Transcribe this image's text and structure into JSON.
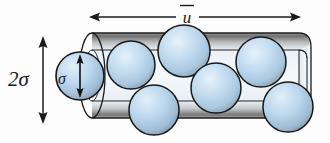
{
  "figure": {
    "name": "collision-cylinder-diagram",
    "caption_visible": false,
    "background_color": "#fdfdfd"
  },
  "labels": {
    "length_label": "ū",
    "length_label_plain": "u-bar",
    "diameter_label": "2σ",
    "radius_label": "σ"
  },
  "colors": {
    "sphere_fill_light": "#d8eaf7",
    "sphere_fill_mid": "#b4d4ec",
    "sphere_fill_dark": "#8fa9bd",
    "sphere_outline": "#1c1c1c",
    "cylinder_top_dark": "#6e6e6e",
    "cylinder_top_light": "#e9ecee",
    "cylinder_body_light": "#eef4f8",
    "cylinder_body_tint": "#dfeaf2",
    "cylinder_outline": "#1c1c1c",
    "arrow_color": "#1a1a1a",
    "text_color": "#1a1a1a"
  },
  "annotations": {
    "length_arrow": {
      "name": "mean-speed-arrow",
      "orientation": "horizontal",
      "double_headed": true,
      "x_start": 90,
      "x_end": 300,
      "y": 17,
      "label": "ū"
    },
    "diameter_arrow": {
      "name": "cylinder-diameter-arrow",
      "orientation": "vertical",
      "double_headed": true,
      "x": 43,
      "y_start": 38,
      "y_end": 122,
      "label": "2σ"
    },
    "radius_arrow": {
      "name": "molecule-diameter-arrow",
      "orientation": "vertical",
      "double_headed": true,
      "x": 80,
      "y_start": 56,
      "y_end": 96,
      "label": "σ"
    }
  },
  "cylinder": {
    "name": "collision-cylinder",
    "left_x": 92,
    "right_x": 305,
    "top_y": 33,
    "bottom_y": 118,
    "cap_rx": 13,
    "cap_ry": 42
  },
  "spheres": [
    {
      "id": "lead-molecule",
      "cx": 80,
      "cy": 76,
      "r": 24
    },
    {
      "id": "molecule-1",
      "cx": 131,
      "cy": 65,
      "r": 24
    },
    {
      "id": "molecule-2",
      "cx": 184,
      "cy": 51,
      "r": 26
    },
    {
      "id": "molecule-3",
      "cx": 154,
      "cy": 110,
      "r": 25
    },
    {
      "id": "molecule-4",
      "cx": 216,
      "cy": 88,
      "r": 25
    },
    {
      "id": "molecule-5",
      "cx": 261,
      "cy": 62,
      "r": 25
    },
    {
      "id": "molecule-6",
      "cx": 288,
      "cy": 107,
      "r": 25
    }
  ]
}
